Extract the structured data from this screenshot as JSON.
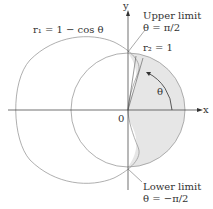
{
  "labels": {
    "r1": "r₁ = 1 − cos θ",
    "upper1": "Upper limit",
    "upper2": "θ = π/2",
    "r2": "r₂ = 1",
    "theta": "θ",
    "origin": "0",
    "x": "x",
    "y": "y",
    "lower1": "Lower limit",
    "lower2": "θ = −π/2"
  },
  "colors": {
    "curve": "#9a9a9a",
    "fill": "#e6e6e6",
    "axis": "#333333"
  }
}
